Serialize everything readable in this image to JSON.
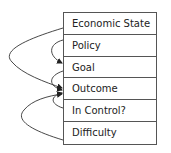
{
  "diagram": {
    "rows": [
      {
        "label": "Economic State"
      },
      {
        "label": "Policy"
      },
      {
        "label": "Goal"
      },
      {
        "label": "Outcome"
      },
      {
        "label": "In Control?"
      },
      {
        "label": "Difficulty"
      }
    ],
    "arrows": [
      {
        "from": "Economic State",
        "to": "Outcome"
      },
      {
        "from": "Policy",
        "to": "Goal"
      },
      {
        "from": "Goal",
        "to": "Outcome"
      },
      {
        "from": "In Control?",
        "to": "Outcome"
      },
      {
        "from": "Difficulty",
        "to": "Outcome"
      }
    ],
    "colors": {
      "line": "#333333",
      "border": "#555555",
      "text": "#222222"
    }
  }
}
